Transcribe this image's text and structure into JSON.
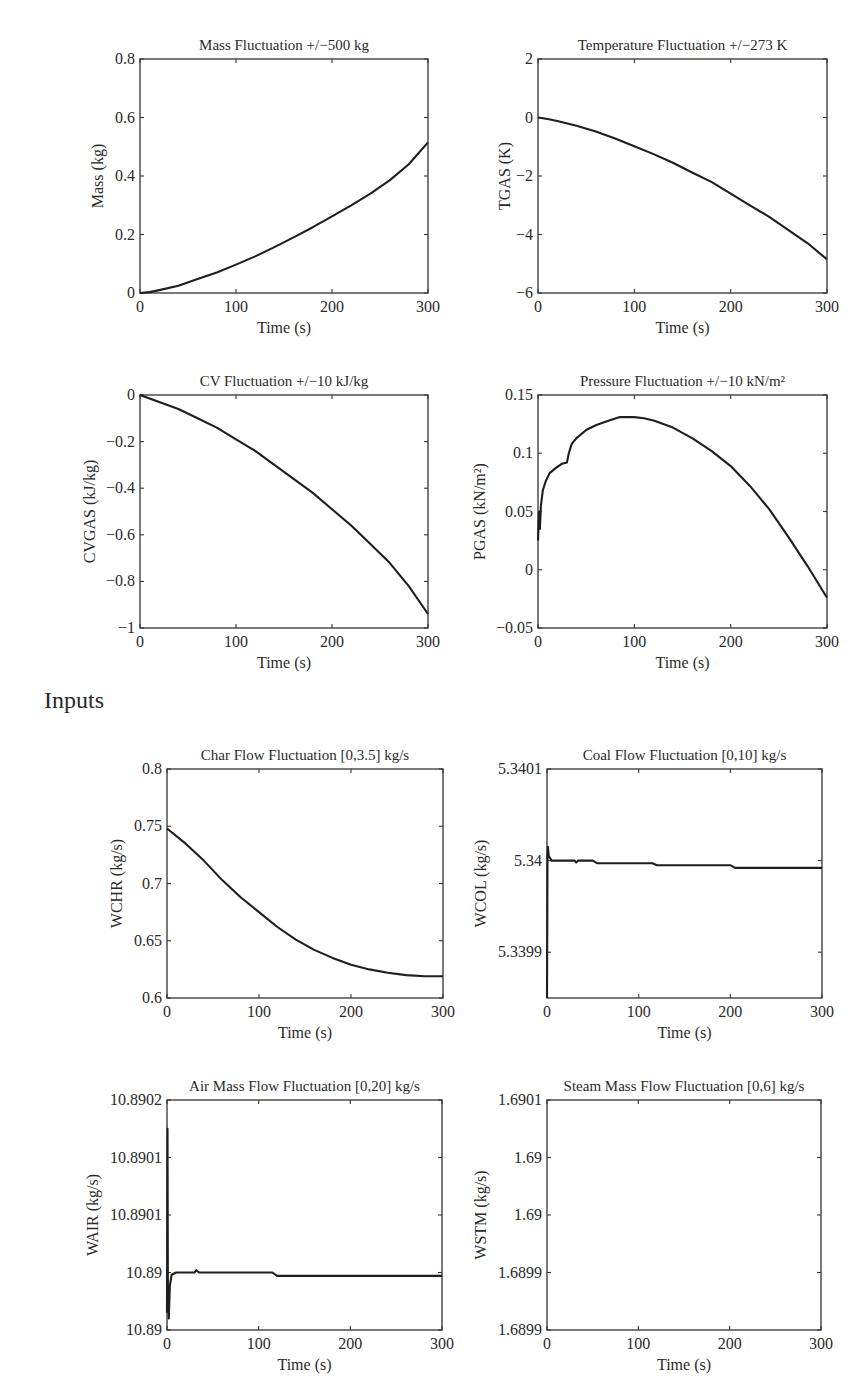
{
  "sections": {
    "inputs_heading": "Inputs"
  },
  "chart_data": [
    {
      "id": "mass",
      "type": "line",
      "title": "Mass Fluctuation +/−500 kg",
      "xlabel": "Time (s)",
      "ylabel": "Mass (kg)",
      "xlim": [
        0,
        300
      ],
      "ylim": [
        0,
        0.8
      ],
      "xticks": [
        0,
        100,
        200,
        300
      ],
      "xtick_labels": [
        "0",
        "100",
        "200",
        "300"
      ],
      "yticks": [
        0,
        0.2,
        0.4,
        0.6,
        0.8
      ],
      "ytick_labels": [
        "0",
        "0.2",
        "0.4",
        "0.6",
        "0.8"
      ],
      "grid": false,
      "series": [
        {
          "name": "Mass",
          "x": [
            0,
            10,
            20,
            40,
            60,
            80,
            100,
            120,
            140,
            160,
            180,
            200,
            220,
            240,
            260,
            280,
            300
          ],
          "y": [
            0,
            0.003,
            0.01,
            0.025,
            0.048,
            0.07,
            0.097,
            0.125,
            0.157,
            0.19,
            0.225,
            0.262,
            0.3,
            0.34,
            0.385,
            0.44,
            0.515
          ]
        }
      ]
    },
    {
      "id": "temperature",
      "type": "line",
      "title": "Temperature Fluctuation +/−273 K",
      "xlabel": "Time (s)",
      "ylabel": "TGAS (K)",
      "xlim": [
        0,
        300
      ],
      "ylim": [
        -6,
        2
      ],
      "xticks": [
        0,
        100,
        200,
        300
      ],
      "xtick_labels": [
        "0",
        "100",
        "200",
        "300"
      ],
      "yticks": [
        -6,
        -4,
        -2,
        0,
        2
      ],
      "ytick_labels": [
        "−6",
        "−4",
        "−2",
        "0",
        "2"
      ],
      "grid": false,
      "series": [
        {
          "name": "TGAS",
          "x": [
            0,
            10,
            20,
            40,
            60,
            80,
            100,
            120,
            140,
            160,
            180,
            200,
            220,
            240,
            260,
            280,
            300
          ],
          "y": [
            0,
            -0.05,
            -0.12,
            -0.28,
            -0.48,
            -0.72,
            -0.98,
            -1.25,
            -1.55,
            -1.88,
            -2.2,
            -2.6,
            -3.0,
            -3.4,
            -3.85,
            -4.3,
            -4.85
          ]
        }
      ]
    },
    {
      "id": "cv",
      "type": "line",
      "title": "CV Fluctuation +/−10 kJ/kg",
      "xlabel": "Time (s)",
      "ylabel": "CVGAS (kJ/kg)",
      "xlim": [
        0,
        300
      ],
      "ylim": [
        -1,
        0
      ],
      "xticks": [
        0,
        100,
        200,
        300
      ],
      "xtick_labels": [
        "0",
        "100",
        "200",
        "300"
      ],
      "yticks": [
        -1,
        -0.8,
        -0.6,
        -0.4,
        -0.2,
        0
      ],
      "ytick_labels": [
        "−1",
        "−0.8",
        "−0.6",
        "−0.4",
        "−0.2",
        "0"
      ],
      "grid": false,
      "series": [
        {
          "name": "CVGAS",
          "x": [
            0,
            10,
            20,
            40,
            60,
            80,
            100,
            120,
            140,
            160,
            180,
            200,
            220,
            240,
            260,
            280,
            300
          ],
          "y": [
            0,
            -0.015,
            -0.03,
            -0.06,
            -0.1,
            -0.14,
            -0.19,
            -0.24,
            -0.3,
            -0.36,
            -0.42,
            -0.49,
            -0.56,
            -0.64,
            -0.72,
            -0.82,
            -0.94
          ]
        }
      ]
    },
    {
      "id": "pressure",
      "type": "line",
      "title": "Pressure Fluctuation +/−10 kN/m²",
      "xlabel": "Time (s)",
      "ylabel": "PGAS (kN/m²)",
      "xlim": [
        0,
        300
      ],
      "ylim": [
        -0.05,
        0.15
      ],
      "xticks": [
        0,
        100,
        200,
        300
      ],
      "xtick_labels": [
        "0",
        "100",
        "200",
        "300"
      ],
      "yticks": [
        -0.05,
        0,
        0.05,
        0.1,
        0.15
      ],
      "ytick_labels": [
        "−0.05",
        "0",
        "0.05",
        "0.1",
        "0.15"
      ],
      "grid": false,
      "series": [
        {
          "name": "PGAS",
          "x": [
            0,
            1,
            2,
            3,
            5,
            8,
            12,
            18,
            25,
            30,
            32,
            35,
            40,
            50,
            60,
            70,
            85,
            100,
            110,
            120,
            140,
            160,
            180,
            200,
            220,
            240,
            260,
            280,
            300
          ],
          "y": [
            0.025,
            0.05,
            0.035,
            0.055,
            0.068,
            0.076,
            0.083,
            0.087,
            0.091,
            0.092,
            0.1,
            0.108,
            0.113,
            0.12,
            0.124,
            0.127,
            0.131,
            0.131,
            0.13,
            0.128,
            0.122,
            0.113,
            0.102,
            0.089,
            0.072,
            0.052,
            0.028,
            0.003,
            -0.024
          ]
        }
      ]
    },
    {
      "id": "char_flow",
      "type": "line",
      "title": "Char Flow Fluctuation [0,3.5] kg/s",
      "xlabel": "Time (s)",
      "ylabel": "WCHR (kg/s)",
      "xlim": [
        0,
        300
      ],
      "ylim": [
        0.6,
        0.8
      ],
      "xticks": [
        0,
        100,
        200,
        300
      ],
      "xtick_labels": [
        "0",
        "100",
        "200",
        "300"
      ],
      "yticks": [
        0.6,
        0.65,
        0.7,
        0.75,
        0.8
      ],
      "ytick_labels": [
        "0.6",
        "0.65",
        "0.7",
        "0.75",
        "0.8"
      ],
      "grid": false,
      "series": [
        {
          "name": "WCHR",
          "x": [
            0,
            20,
            40,
            60,
            80,
            100,
            120,
            140,
            160,
            180,
            200,
            220,
            240,
            260,
            280,
            300
          ],
          "y": [
            0.748,
            0.735,
            0.72,
            0.703,
            0.688,
            0.675,
            0.662,
            0.651,
            0.642,
            0.635,
            0.629,
            0.625,
            0.622,
            0.62,
            0.619,
            0.619
          ]
        }
      ]
    },
    {
      "id": "coal_flow",
      "type": "line",
      "title": "Coal Flow Fluctuation [0,10] kg/s",
      "xlabel": "Time (s)",
      "ylabel": "WCOL (kg/s)",
      "xlim": [
        0,
        300
      ],
      "ylim": [
        5.33985,
        5.3401
      ],
      "xticks": [
        0,
        100,
        200,
        300
      ],
      "xtick_labels": [
        "0",
        "100",
        "200",
        "300"
      ],
      "yticks": [
        5.3399,
        5.34,
        5.3401
      ],
      "ytick_labels": [
        "5.3399",
        "5.34",
        "5.3401"
      ],
      "grid": false,
      "series": [
        {
          "name": "WCOL",
          "x": [
            0,
            0.5,
            1,
            2,
            5,
            30,
            32,
            34,
            50,
            55,
            115,
            120,
            200,
            205,
            300
          ],
          "y": [
            5.33985,
            5.340005,
            5.340015,
            5.340005,
            5.34,
            5.34,
            5.339998,
            5.34,
            5.34,
            5.339997,
            5.339997,
            5.339995,
            5.339995,
            5.339992,
            5.339992
          ]
        }
      ]
    },
    {
      "id": "air_flow",
      "type": "line",
      "title": "Air Mass Flow Fluctuation [0,20] kg/s",
      "xlabel": "Time (s)",
      "ylabel": "WAIR (kg/s)",
      "xlim": [
        0,
        300
      ],
      "ylim": [
        10.88996,
        10.89016
      ],
      "xticks": [
        0,
        100,
        200,
        300
      ],
      "xtick_labels": [
        "0",
        "100",
        "200",
        "300"
      ],
      "yticks": [
        10.88996,
        10.89001,
        10.89006,
        10.89011,
        10.89016
      ],
      "ytick_labels": [
        "10.89",
        "10.89",
        "10.8901",
        "10.8901",
        "10.8902"
      ],
      "grid": false,
      "series": [
        {
          "name": "WAIR",
          "x": [
            0,
            0.5,
            1,
            2,
            3,
            5,
            10,
            30,
            32,
            35,
            115,
            120,
            300
          ],
          "y": [
            10.889975,
            10.890135,
            10.88999,
            10.88997,
            10.889998,
            10.890008,
            10.89001,
            10.89001,
            10.890012,
            10.89001,
            10.89001,
            10.890007,
            10.890007
          ]
        }
      ]
    },
    {
      "id": "steam_flow",
      "type": "line",
      "title": "Steam Mass Flow Fluctuation [0,6] kg/s",
      "xlabel": "Time (s)",
      "ylabel": "WSTM (kg/s)",
      "xlim": [
        0,
        300
      ],
      "ylim": [
        1.68986,
        1.69006
      ],
      "xticks": [
        0,
        100,
        200,
        300
      ],
      "xtick_labels": [
        "0",
        "100",
        "200",
        "300"
      ],
      "yticks": [
        1.68986,
        1.68991,
        1.68996,
        1.69001,
        1.69006
      ],
      "ytick_labels": [
        "1.6899",
        "1.6899",
        "1.69",
        "1.69",
        "1.6901"
      ],
      "grid": false,
      "series": [
        {
          "name": "WSTM",
          "x": [],
          "y": []
        }
      ]
    }
  ]
}
